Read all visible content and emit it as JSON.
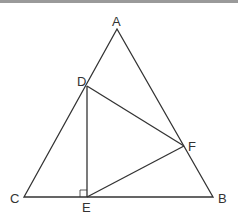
{
  "diagram": {
    "type": "geometry",
    "points": {
      "A": {
        "label": "A",
        "x": 117,
        "y": 29
      },
      "B": {
        "label": "B",
        "x": 213,
        "y": 197
      },
      "C": {
        "label": "C",
        "x": 24,
        "y": 197
      },
      "D": {
        "label": "D",
        "x": 87,
        "y": 86
      },
      "E": {
        "label": "E",
        "x": 87,
        "y": 197
      },
      "F": {
        "label": "F",
        "x": 184,
        "y": 146
      }
    },
    "segments": [
      "AB",
      "BC",
      "CA",
      "DE",
      "EF",
      "FD"
    ],
    "right_angle_at": "E",
    "line_color": "#333333"
  }
}
